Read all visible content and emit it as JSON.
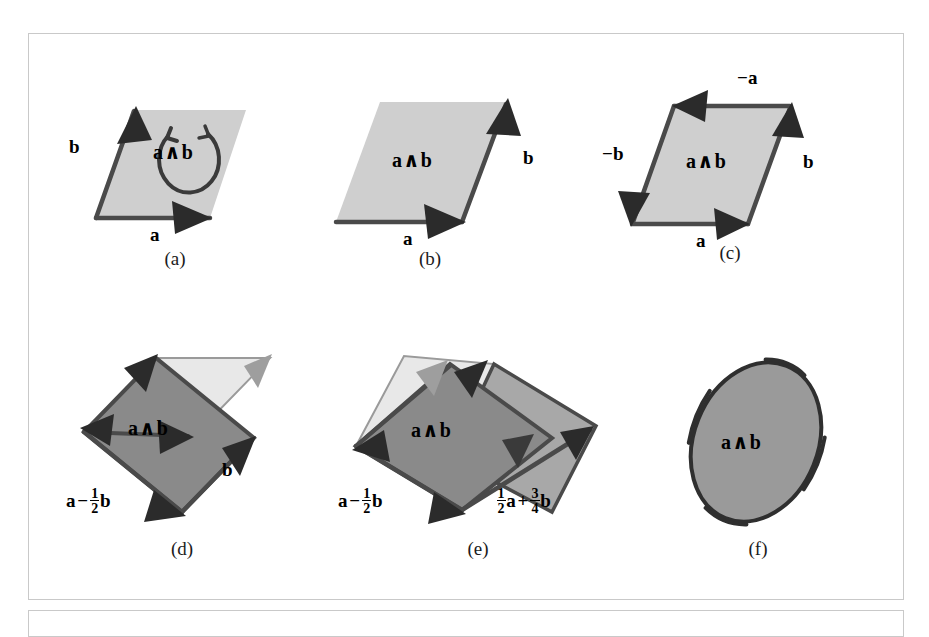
{
  "figure": {
    "background_color": "#ffffff",
    "frame_color": "#c9c9c9",
    "light_fill": "#cfcfcf",
    "mid_fill": "#b4b4b4",
    "dark_fill": "#8a8a8a",
    "ellipse_fill": "#9a9a9a",
    "stroke_color": "#4a4a4a",
    "arrow_color": "#2b2b2b",
    "pale_fill": "#e8e8e8"
  },
  "panels": [
    {
      "id": "a",
      "caption": "(a)",
      "area_label": "a ∧ b",
      "labels": [
        {
          "name": "vector-a",
          "text": "a"
        },
        {
          "name": "vector-b",
          "text": "b"
        }
      ],
      "orientation_arrow": "counterclockwise-circular-arrow"
    },
    {
      "id": "b",
      "caption": "(b)",
      "area_label": "a ∧ b",
      "labels": [
        {
          "name": "vector-a",
          "text": "a"
        },
        {
          "name": "vector-b",
          "text": "b"
        }
      ],
      "orientation_arrow": "none"
    },
    {
      "id": "c",
      "caption": "(c)",
      "area_label": "a ∧ b",
      "labels": [
        {
          "name": "vector-a",
          "text": "a"
        },
        {
          "name": "vector-b",
          "text": "b"
        },
        {
          "name": "vector-minus-a",
          "text": "−a"
        },
        {
          "name": "vector-minus-b",
          "text": "−b"
        }
      ],
      "orientation_arrow": "none"
    },
    {
      "id": "d",
      "caption": "(d)",
      "area_label": "a ∧ b",
      "labels": [
        {
          "name": "vector-b",
          "text": "b"
        },
        {
          "name": "vector-a-minus-half-b",
          "text": "a − (1/2)b"
        }
      ],
      "orientation_arrow": "none"
    },
    {
      "id": "e",
      "caption": "(e)",
      "area_label": "a ∧ b",
      "labels": [
        {
          "name": "vector-a-minus-half-b",
          "text": "a − (1/2)b"
        },
        {
          "name": "vector-half-a-plus-three-quarter-b",
          "text": "(1/2)a + (3/4)b"
        }
      ],
      "orientation_arrow": "none"
    },
    {
      "id": "f",
      "caption": "(f)",
      "area_label": "a ∧ b",
      "labels": [],
      "orientation_arrow": "none"
    }
  ],
  "symbols": {
    "wedge": "∧",
    "minus": "−",
    "letter_a": "a",
    "letter_b": "b",
    "one": "1",
    "two": "2",
    "three": "3",
    "four": "4",
    "plus": "+"
  }
}
